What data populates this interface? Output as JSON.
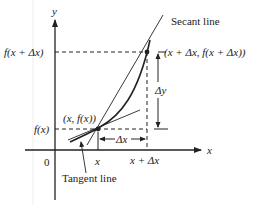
{
  "diagram": {
    "axes": {
      "x_label": "x",
      "y_label": "y",
      "origin_label": "0"
    },
    "y_labels": {
      "f_x_plus_dx": "f(x + Δx)",
      "f_x": "f(x)"
    },
    "x_labels": {
      "x": "x",
      "x_plus_dx": "x + Δx"
    },
    "points": {
      "p1": "(x, f(x))",
      "p2": "(x + Δx, f(x + Δx))"
    },
    "annotations": {
      "secant": "Secant line",
      "tangent": "Tangent line",
      "delta_y": "Δy",
      "delta_x": "Δx"
    },
    "colors": {
      "line": "#222222",
      "background": "#ffffff"
    }
  }
}
